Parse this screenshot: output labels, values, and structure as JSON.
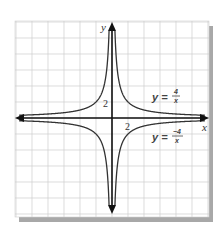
{
  "chart_data": {
    "type": "line",
    "title": "",
    "xlabel": "x",
    "ylabel": "y",
    "xlim": [
      -12,
      12
    ],
    "ylim": [
      -12,
      12
    ],
    "grid": true,
    "grid_step": 2,
    "tick_labels": {
      "x": "2",
      "y": "2"
    },
    "series": [
      {
        "name": "y = 4/x",
        "function": "4/x",
        "numerator": "4",
        "denominator": "x",
        "label_prefix": "y =",
        "points": [
          [
            -12,
            -0.33
          ],
          [
            -8,
            -0.5
          ],
          [
            -4,
            -1
          ],
          [
            -2,
            -2
          ],
          [
            -1,
            -4
          ],
          [
            -0.5,
            -8
          ],
          [
            0.5,
            8
          ],
          [
            1,
            4
          ],
          [
            2,
            2
          ],
          [
            4,
            1
          ],
          [
            8,
            0.5
          ],
          [
            12,
            0.33
          ]
        ]
      },
      {
        "name": "y = -4/x",
        "function": "-4/x",
        "numerator": "−4",
        "denominator": "x",
        "label_prefix": "y =",
        "points": [
          [
            -12,
            0.33
          ],
          [
            -8,
            0.5
          ],
          [
            -4,
            1
          ],
          [
            -2,
            2
          ],
          [
            -1,
            4
          ],
          [
            -0.5,
            8
          ],
          [
            0.5,
            -8
          ],
          [
            1,
            -4
          ],
          [
            2,
            -2
          ],
          [
            4,
            -1
          ],
          [
            8,
            -0.5
          ],
          [
            12,
            -0.33
          ]
        ]
      }
    ],
    "legend": "inline labels right side"
  },
  "labels": {
    "x_axis": "x",
    "y_axis": "y",
    "x_tick": "2",
    "y_tick": "2",
    "eq1_prefix": "y =",
    "eq1_num": "4",
    "eq1_den": "x",
    "eq2_prefix": "y =",
    "eq2_num": "−4",
    "eq2_den": "x"
  },
  "colors": {
    "grid": "#c8c8c8",
    "axis": "#111111",
    "curve": "#333333",
    "shadow": "#9a9a9a"
  }
}
